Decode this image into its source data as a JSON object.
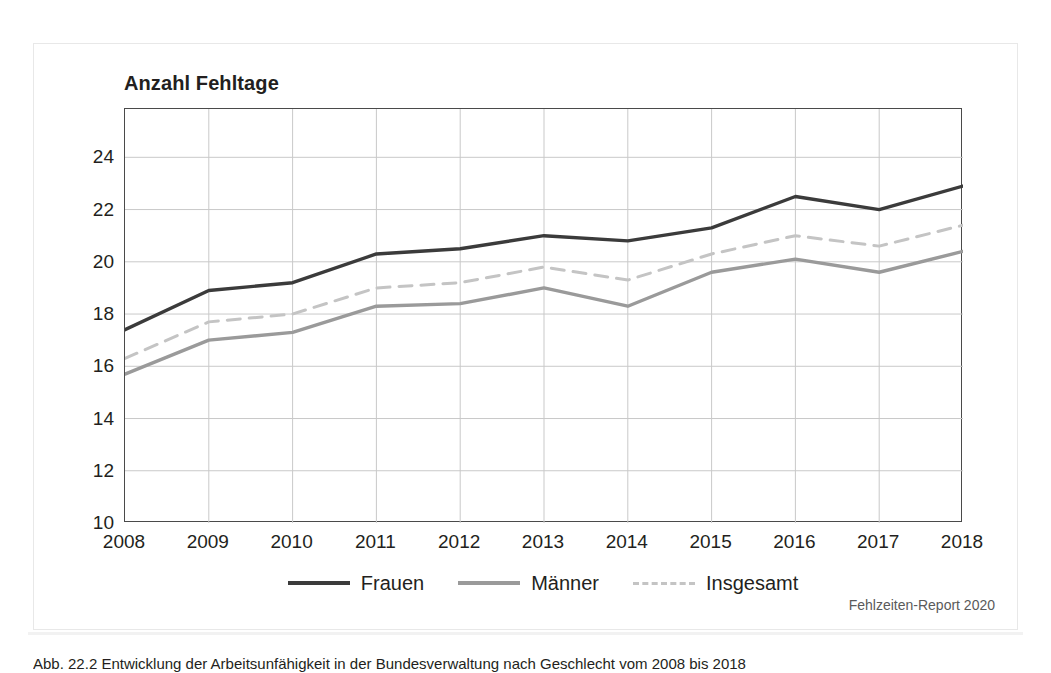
{
  "chart_data": {
    "type": "line",
    "title": "Anzahl Fehltage",
    "xlabel": "",
    "ylabel": "Anzahl Fehltage",
    "categories": [
      "2008",
      "2009",
      "2010",
      "2011",
      "2012",
      "2013",
      "2014",
      "2015",
      "2016",
      "2017",
      "2018"
    ],
    "x": [
      2008,
      2009,
      2010,
      2011,
      2012,
      2013,
      2014,
      2015,
      2016,
      2017,
      2018
    ],
    "ylim": [
      10,
      25.85
    ],
    "xlim": [
      2008,
      2018
    ],
    "yticks": [
      10,
      12,
      14,
      16,
      18,
      20,
      22,
      24
    ],
    "ytick_labels": [
      "10",
      "12",
      "14",
      "16",
      "18",
      "20",
      "22",
      "24"
    ],
    "grid": true,
    "grid_axes": "both",
    "legend_position": "bottom-center",
    "series": [
      {
        "name": "Frauen",
        "style": "solid",
        "color": "#3b3b3b",
        "values": [
          17.4,
          18.9,
          19.2,
          20.3,
          20.5,
          21.0,
          20.8,
          21.3,
          22.5,
          22.0,
          22.9
        ]
      },
      {
        "name": "Männer",
        "style": "solid",
        "color": "#9a9a9a",
        "values": [
          15.7,
          17.0,
          17.3,
          18.3,
          18.4,
          19.0,
          18.3,
          19.6,
          20.1,
          19.6,
          20.4
        ]
      },
      {
        "name": "Insgesamt",
        "style": "dashed",
        "color": "#c4c4c4",
        "values": [
          16.3,
          17.7,
          18.0,
          19.0,
          19.2,
          19.8,
          19.3,
          20.3,
          21.0,
          20.6,
          21.4
        ]
      }
    ],
    "source": "Fehlzeiten-Report 2020"
  },
  "chart": {
    "title": "Anzahl Fehltage",
    "source_credit": "Fehlzeiten-Report 2020"
  },
  "legend": {
    "entries": [
      {
        "label": "Frauen"
      },
      {
        "label": "Männer"
      },
      {
        "label": "Insgesamt"
      }
    ]
  },
  "caption": {
    "label": "Abb.",
    "text": "Abb. 22.2 Entwicklung der Arbeitsunfähigkeit in der Bundesverwaltung nach Geschlecht vom 2008 bis 2018"
  }
}
